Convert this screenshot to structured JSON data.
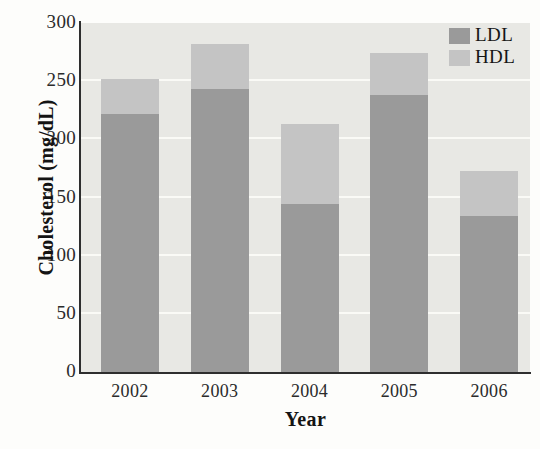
{
  "chart_data": {
    "type": "bar",
    "subtype": "stacked-bar",
    "title": "",
    "xlabel": "Year",
    "ylabel": "Cholesterol (mg/dL)",
    "categories": [
      "2002",
      "2003",
      "2004",
      "2005",
      "2006"
    ],
    "series": [
      {
        "name": "LDL",
        "color": "#9a9a9a",
        "values": [
          222,
          243,
          144,
          238,
          134
        ]
      },
      {
        "name": "HDL",
        "color": "#c4c4c4",
        "values": [
          30,
          39,
          69,
          36,
          39
        ]
      }
    ],
    "totals": [
      252,
      282,
      213,
      274,
      173
    ],
    "ylim": [
      0,
      300
    ],
    "yticks": [
      0,
      50,
      100,
      150,
      200,
      250,
      300
    ],
    "ytick_labels": [
      "0",
      "50",
      "100",
      "150",
      "200",
      "250",
      "300"
    ],
    "grid": "horizontal",
    "legend_position": "top-right",
    "plot_background": "#e8e8e4",
    "axis_color": "#2e2e2e"
  },
  "legend": {
    "entries": [
      {
        "label": "LDL",
        "color": "#9a9a9a"
      },
      {
        "label": "HDL",
        "color": "#c4c4c4"
      }
    ]
  },
  "axes": {
    "x_title": "Year",
    "y_title": "Cholesterol (mg/dL)"
  }
}
